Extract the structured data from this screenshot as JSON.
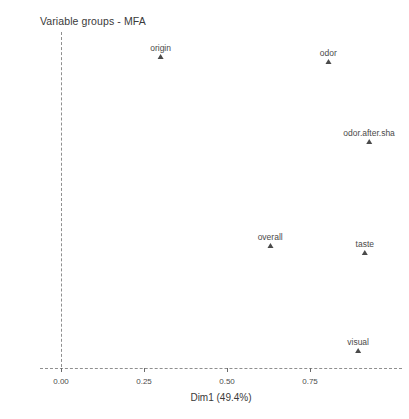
{
  "chart_data": {
    "type": "scatter",
    "title": "Variable groups - MFA",
    "xlabel": "Dim1 (49.4%)",
    "ylabel": "Dim2 (19.5%)",
    "xlim": [
      -0.06,
      1.03
    ],
    "ylim": [
      -0.02,
      0.7
    ],
    "xticks": [
      "0.00",
      "0.25",
      "0.50",
      "0.75"
    ],
    "xtick_values": [
      0.0,
      0.25,
      0.5,
      0.75
    ],
    "yticks": [
      "0.0",
      "0.2",
      "0.4",
      "0.6"
    ],
    "ytick_values": [
      0.0,
      0.2,
      0.4,
      0.6
    ],
    "grid": false,
    "legend": "none",
    "reference_lines": {
      "vertical_at_x": 0.0,
      "horizontal_at_y": 0.0,
      "style": "dashed"
    },
    "marker_shape": "triangle",
    "marker_color": "#4a4a4a",
    "points": [
      {
        "label": "origin",
        "x": 0.3,
        "y": 0.635
      },
      {
        "label": "odor",
        "x": 0.805,
        "y": 0.625
      },
      {
        "label": "odor.after.sha",
        "x": 0.928,
        "y": 0.462
      },
      {
        "label": "overall",
        "x": 0.63,
        "y": 0.25
      },
      {
        "label": "taste",
        "x": 0.915,
        "y": 0.235
      },
      {
        "label": "visual",
        "x": 0.895,
        "y": 0.037
      }
    ]
  },
  "colors": {
    "background": "#ffffff",
    "text": "#4d4d4d",
    "axis": "#6b6b6b",
    "reference_line": "#8f8f8f",
    "marker": "#4a4a4a"
  }
}
